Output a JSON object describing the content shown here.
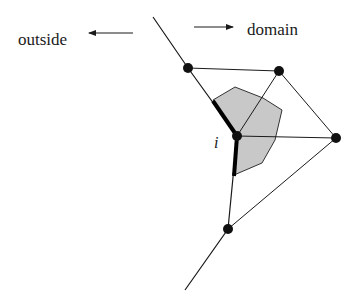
{
  "labels": {
    "outside": "outside",
    "domain": "domain",
    "node": "i"
  },
  "colors": {
    "line": "#1a1a1a",
    "node": "#111111",
    "cell_fill": "#c8c8c8",
    "cell_stroke": "#333333",
    "background": "#ffffff"
  },
  "geometry": {
    "nodes": [
      {
        "id": "n1",
        "x": 188,
        "y": 68
      },
      {
        "id": "n2",
        "x": 279,
        "y": 71
      },
      {
        "id": "n3",
        "x": 336,
        "y": 138
      },
      {
        "id": "i",
        "x": 237,
        "y": 136
      },
      {
        "id": "n5",
        "x": 228,
        "y": 229
      }
    ],
    "boundary_polyline": [
      [
        153,
        17
      ],
      [
        188,
        68
      ],
      [
        237,
        136
      ],
      [
        228,
        229
      ],
      [
        185,
        290
      ]
    ],
    "edges": [
      [
        [
          188,
          68
        ],
        [
          279,
          71
        ]
      ],
      [
        [
          279,
          71
        ],
        [
          336,
          138
        ]
      ],
      [
        [
          279,
          71
        ],
        [
          237,
          136
        ]
      ],
      [
        [
          237,
          136
        ],
        [
          336,
          138
        ]
      ],
      [
        [
          336,
          138
        ],
        [
          228,
          229
        ]
      ]
    ],
    "control_volume": [
      [
        213,
        100
      ],
      [
        235,
        87
      ],
      [
        263,
        98
      ],
      [
        282,
        110
      ],
      [
        275,
        140
      ],
      [
        262,
        163
      ],
      [
        234,
        175
      ],
      [
        237,
        136
      ]
    ]
  }
}
